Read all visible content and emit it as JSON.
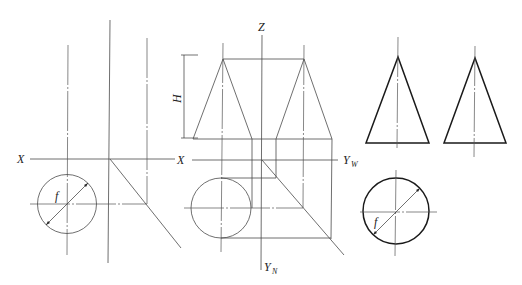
{
  "diagram": {
    "type": "orthographic projection of right circular cone",
    "labels": {
      "x_left": "X",
      "x_middle": "X",
      "z": "Z",
      "y_w": "Y",
      "y_w_sub": "W",
      "y_n": "Y",
      "y_n_sub": "N",
      "height": "H",
      "diameter_left": "f",
      "diameter_right": "f"
    },
    "views": [
      {
        "name": "left-construction",
        "description": "axis setup with base circle and 45° miter line"
      },
      {
        "name": "middle-three-view",
        "description": "front view, side view and top view with projection lines"
      },
      {
        "name": "right-result",
        "description": "completed front and side triangles with top circle"
      }
    ]
  }
}
